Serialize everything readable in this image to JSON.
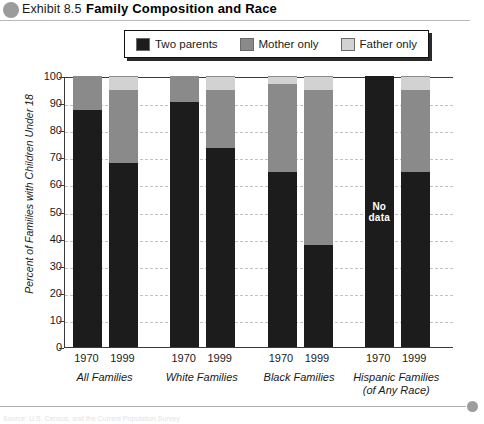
{
  "header": {
    "exhibit_label": "Exhibit 8.5",
    "title": "Family Composition and Race",
    "bullet_icon": "circle-bullet-icon"
  },
  "legend": {
    "items": [
      {
        "label": "Two parents",
        "color": "#1c1c1c",
        "swatch_icon": "legend-swatch-icon"
      },
      {
        "label": "Mother only",
        "color": "#8a8a8a",
        "swatch_icon": "legend-swatch-icon"
      },
      {
        "label": "Father only",
        "color": "#d2d2d2",
        "swatch_icon": "legend-swatch-icon"
      }
    ]
  },
  "footer": {
    "source": "Source: U.S. Census, and the Current Population Survey"
  },
  "chart_data": {
    "type": "bar",
    "subtype": "stacked-100",
    "title": "Family Composition and Race",
    "xlabel": "",
    "ylabel": "Percent of Families with Children Under 18",
    "ylim": [
      0,
      100
    ],
    "yticks": [
      0,
      10,
      20,
      30,
      40,
      50,
      60,
      70,
      80,
      90,
      100
    ],
    "ytick_labels": [
      "0",
      "10",
      "20",
      "30",
      "40",
      "50",
      "60",
      "70",
      "80",
      "90",
      "100"
    ],
    "grid": true,
    "legend_position": "top",
    "groups": [
      {
        "label": "All Families",
        "label_line2": ""
      },
      {
        "label": "White Families",
        "label_line2": ""
      },
      {
        "label": "Black Families",
        "label_line2": ""
      },
      {
        "label": "Hispanic Families",
        "label_line2": "(of Any Race)"
      }
    ],
    "categories": [
      "All Families 1970",
      "All Families 1999",
      "White Families 1970",
      "White Families 1999",
      "Black Families 1970",
      "Black Families 1999",
      "Hispanic Families 1970",
      "Hispanic Families 1999"
    ],
    "year_labels": [
      "1970",
      "1999",
      "1970",
      "1999",
      "1970",
      "1999",
      "1970",
      "1999"
    ],
    "series": [
      {
        "name": "Two parents",
        "color": "#1c1c1c",
        "values": [
          87.5,
          68,
          90.5,
          73.5,
          64.5,
          37.5,
          null,
          64.5
        ]
      },
      {
        "name": "Mother only",
        "color": "#8a8a8a",
        "values": [
          12.5,
          27,
          9.5,
          21.5,
          32.5,
          57.5,
          null,
          30.5
        ]
      },
      {
        "name": "Father only",
        "color": "#d2d2d2",
        "values": [
          0,
          5,
          0,
          5,
          3,
          5,
          null,
          5
        ]
      }
    ],
    "annotations": [
      {
        "target": "Hispanic Families 1970",
        "text": "No\ndata",
        "text_line1": "No",
        "text_line2": "data"
      }
    ]
  }
}
